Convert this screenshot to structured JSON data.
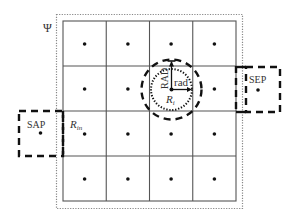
{
  "diagram": {
    "outer_label": "Ψ",
    "grid": {
      "rows": 4,
      "cols": 4
    },
    "labels": {
      "sep": "SEP",
      "sap": "SAP",
      "r_in": "R",
      "r_in_sub": "in",
      "rad": "rad",
      "RAD": "RAD",
      "r_i": "R",
      "r_i_sub": "i"
    },
    "colors": {
      "line": "#555555",
      "dash": "#111111",
      "dot": "#111111",
      "outer_dotted": "#888888"
    }
  }
}
